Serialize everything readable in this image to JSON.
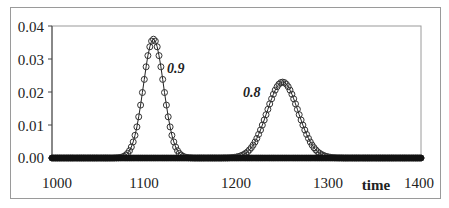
{
  "chart_data": {
    "type": "line",
    "title": "",
    "xlabel": "time",
    "ylabel": "",
    "xlim": [
      1000,
      1400
    ],
    "ylim": [
      0.0,
      0.04
    ],
    "x_ticks": [
      "1000",
      "1100",
      "1200",
      "1300",
      "1400"
    ],
    "y_ticks": [
      "0.00",
      "0.01",
      "0.02",
      "0.03",
      "0.04"
    ],
    "grid": false,
    "legend": null,
    "marker": "open-circle",
    "series": [
      {
        "name": "0.9",
        "shape": "gaussian",
        "peak_x": 1110,
        "peak_y": 0.036,
        "sigma": 11
      },
      {
        "name": "0.8",
        "shape": "gaussian",
        "peak_x": 1250,
        "peak_y": 0.023,
        "sigma": 17
      }
    ],
    "x_step": 2,
    "annotations": [
      {
        "text": "0.9",
        "x": 1124,
        "y": 0.027
      },
      {
        "text": "0.8",
        "x": 1222,
        "y": 0.0225
      }
    ]
  },
  "labels": {
    "xlabel": "time",
    "y0": "0.00",
    "y1": "0.01",
    "y2": "0.02",
    "y3": "0.03",
    "y4": "0.04",
    "x0": "1000",
    "x1": "1100",
    "x2": "1200",
    "x3": "1300",
    "x4": "1400",
    "ann1": "0.9",
    "ann2": "0.8"
  }
}
